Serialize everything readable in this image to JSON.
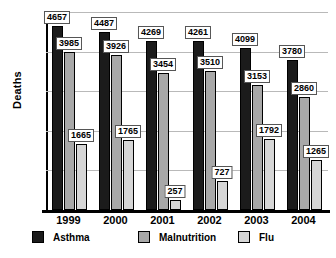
{
  "chart_data": {
    "type": "bar",
    "title": "",
    "xlabel": "",
    "ylabel": "Deaths",
    "ylim": [
      0,
      5000
    ],
    "ytick_step": 1000,
    "yticks": [
      "5000",
      "4000",
      "3000",
      "2000",
      "1000",
      "0"
    ],
    "grid": true,
    "legend_position": "bottom",
    "categories": [
      "1999",
      "2000",
      "2001",
      "2002",
      "2003",
      "2004"
    ],
    "series": [
      {
        "name": "Asthma",
        "color": "#1b1b1b",
        "values": [
          4657,
          4487,
          4269,
          4261,
          4099,
          3780
        ]
      },
      {
        "name": "Malnutrition",
        "color": "#a8a8a8",
        "values": [
          3985,
          3926,
          3454,
          3510,
          3153,
          2860
        ]
      },
      {
        "name": "Flu",
        "color": "#d6d6d6",
        "values": [
          1665,
          1765,
          257,
          727,
          1792,
          1265
        ]
      }
    ]
  }
}
